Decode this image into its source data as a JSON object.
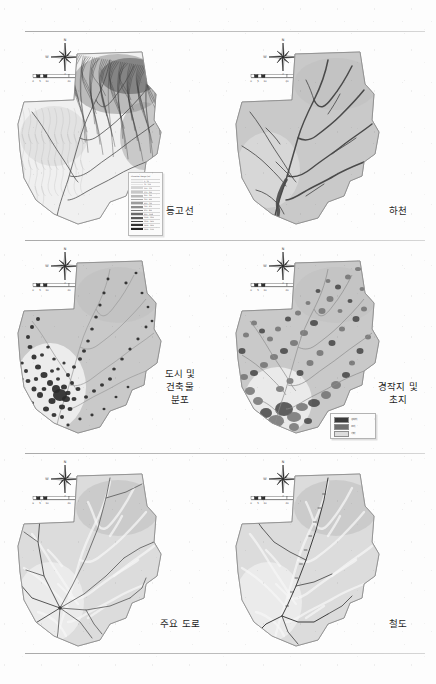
{
  "page": {
    "background_color": "#fdfdfd",
    "divider_color": "#9b9b9b",
    "map_fill_color": "#c9c9c9",
    "map_outline_color": "#8a8a8a",
    "river_color": "#4a4a4a",
    "road_color": "#555555",
    "rail_color": "#3d3d3d",
    "urban_color": "#2a2a2a"
  },
  "compass": {
    "north_label": "N",
    "south_label": "S",
    "east_label": "E",
    "west_label": "W"
  },
  "scalebar": {
    "ticks": [
      "0",
      "5",
      "10",
      "20",
      "30"
    ],
    "unit": "km"
  },
  "panels": [
    {
      "id": "contour",
      "label": "등고선",
      "label_lines": [
        "등고선"
      ],
      "theme": "contour",
      "row": 1,
      "column": "left",
      "has_legend": true,
      "legend_type": "tall"
    },
    {
      "id": "river",
      "label": "하천",
      "label_lines": [
        "하천"
      ],
      "theme": "river",
      "row": 1,
      "column": "right",
      "has_legend": false,
      "legend_type": "none"
    },
    {
      "id": "urban",
      "label": "도시 및 건축물 분포",
      "label_lines": [
        "도시 및",
        "건축물",
        "분포"
      ],
      "theme": "urban",
      "row": 2,
      "column": "left",
      "has_legend": false,
      "legend_type": "none"
    },
    {
      "id": "farmland",
      "label": "경작지 및 초지",
      "label_lines": [
        "경작지 및",
        "초지"
      ],
      "theme": "farmland",
      "row": 2,
      "column": "right",
      "has_legend": true,
      "legend_type": "small"
    },
    {
      "id": "road",
      "label": "주요 도로",
      "label_lines": [
        "주요 도로"
      ],
      "theme": "road",
      "row": 3,
      "column": "left",
      "has_legend": false,
      "legend_type": "none"
    },
    {
      "id": "railway",
      "label": "철도",
      "label_lines": [
        "철도"
      ],
      "theme": "railway",
      "row": 3,
      "column": "right",
      "has_legend": false,
      "legend_type": "none"
    }
  ],
  "legend_tall": {
    "title": "Elevation Range (m)",
    "rows": [
      {
        "swatch": "#f2f2f2",
        "text": "0 - 50"
      },
      {
        "swatch": "#e4e4e4",
        "text": "50 - 100"
      },
      {
        "swatch": "#d6d6d6",
        "text": "100 - 150"
      },
      {
        "swatch": "#c8c8c8",
        "text": "150 - 200"
      },
      {
        "swatch": "#bababa",
        "text": "200 - 300"
      },
      {
        "swatch": "#ababab",
        "text": "300 - 400"
      },
      {
        "swatch": "#9c9c9c",
        "text": "400 - 500"
      },
      {
        "swatch": "#8d8d8d",
        "text": "500 - 650"
      },
      {
        "swatch": "#7d7d7d",
        "text": "650 - 800"
      },
      {
        "swatch": "#6c6c6c",
        "text": "800 - 1000"
      },
      {
        "swatch": "#5a5a5a",
        "text": "1000 - 1200"
      },
      {
        "swatch": "#474747",
        "text": "1200 - 1400"
      },
      {
        "swatch": "#343434",
        "text": "1400 - 1600"
      },
      {
        "swatch": "#222222",
        "text": "1600 - 1900"
      }
    ]
  },
  "legend_small": {
    "rows": [
      {
        "swatch": "#3a3a3a",
        "text": "경작지"
      },
      {
        "swatch": "#6e6e6e",
        "text": "초지"
      },
      {
        "swatch": "#dcdcdc",
        "text": "기타"
      }
    ]
  }
}
